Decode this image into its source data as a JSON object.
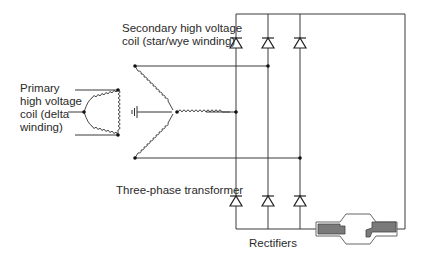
{
  "labels": {
    "primary": [
      "Primary",
      "high voltage",
      "coil (delta",
      "winding)"
    ],
    "secondary": [
      "Secondary high voltage",
      "coil (star/wye winding)"
    ],
    "transformer": "Three-phase transformer",
    "rectifiers": "Rectifiers"
  },
  "components": {
    "primary_coil": "delta-winding",
    "secondary_coil": "wye-winding",
    "ground": "ground-symbol",
    "diodes_top": 3,
    "diodes_bottom": 3,
    "load": "x-ray-tube"
  },
  "colors": {
    "line": "#3a3a3a",
    "tube_fill": "#7a7a7a",
    "tube_outline": "#555555"
  }
}
